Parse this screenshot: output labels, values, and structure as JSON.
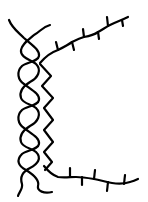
{
  "diagram": {
    "description": "Line drawing of a twisted double strand (helix) with an adjacent zigzag strand branching into two ticked chains",
    "colors": {
      "background": "#ffffff",
      "stroke": "#000000"
    },
    "parts": [
      {
        "id": "helix",
        "label": "twisted double strand"
      },
      {
        "id": "zigzag",
        "label": "zigzag strand"
      },
      {
        "id": "upper-chain",
        "label": "upper ticked chain"
      },
      {
        "id": "lower-chain",
        "label": "lower ticked chain"
      }
    ]
  }
}
